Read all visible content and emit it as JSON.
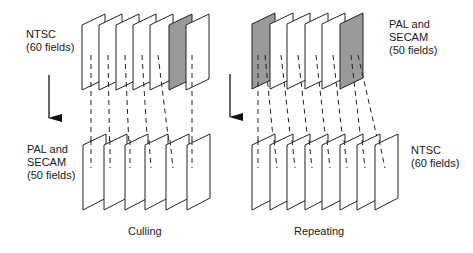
{
  "diagram": {
    "left": {
      "caption": "Culling",
      "top_label": "NTSC\n(60 fields)",
      "bottom_label": "PAL and\nSECAM\n(50 fields)",
      "top_fields": {
        "count": 7,
        "shaded": [
          6
        ]
      },
      "bottom_fields": {
        "count": 6,
        "shaded": []
      },
      "mapping": [
        [
          1,
          1
        ],
        [
          2,
          2
        ],
        [
          3,
          3
        ],
        [
          4,
          4
        ],
        [
          5,
          5
        ],
        [
          7,
          6
        ]
      ],
      "note": "Field 6 of NTSC is dropped"
    },
    "right": {
      "caption": "Repeating",
      "top_label": "PAL and\nSECAM\n(50 fields)",
      "bottom_label": "NTSC\n(60 fields)",
      "top_fields": {
        "count": 6,
        "shaded": [
          1,
          6
        ]
      },
      "bottom_fields": {
        "count": 8,
        "shaded": []
      },
      "mapping": [
        [
          1,
          1
        ],
        [
          1,
          2
        ],
        [
          2,
          3
        ],
        [
          3,
          4
        ],
        [
          4,
          5
        ],
        [
          5,
          6
        ],
        [
          6,
          7
        ],
        [
          6,
          8
        ]
      ],
      "note": "Shaded fields are repeated"
    },
    "colors": {
      "shaded": "#9a9a9a",
      "stroke": "#222222",
      "fill": "#ffffff"
    }
  }
}
